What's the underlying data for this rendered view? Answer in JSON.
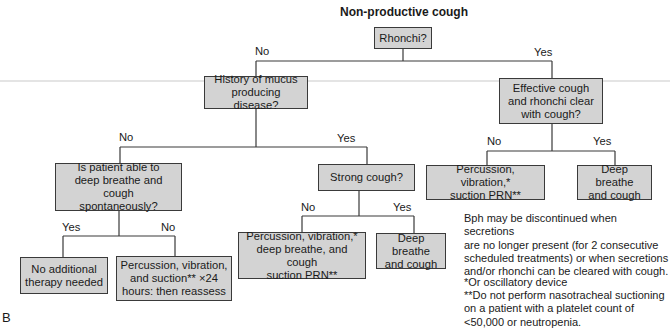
{
  "title": "Non-productive cough",
  "figure_label": "B",
  "nodes": {
    "rhonchi": "Rhonchi?",
    "history": "History of mucus\nproducing disease?",
    "effective": "Effective cough\nand rhonchi clear\nwith cough?",
    "able": "Is patient able to\ndeep breathe and cough\nspontaneously?",
    "strong": "Strong cough?",
    "perc_right": "Percussion, vibration,*\nsuction PRN**",
    "deep_right": "Deep breathe\nand cough",
    "no_therapy": "No additional\ntherapy needed",
    "perc_24": "Percussion, vibration,\nand suction** ×24\nhours: then reassess",
    "perc_mid": "Percussion, vibration,*\ndeep breathe, and cough\nsuction PRN**",
    "deep_mid": "Deep breathe\nand cough"
  },
  "edge_labels": {
    "rhonchi_no": "No",
    "rhonchi_yes": "Yes",
    "history_no": "No",
    "history_yes": "Yes",
    "effective_no": "No",
    "effective_yes": "Yes",
    "able_yes": "Yes",
    "able_no": "No",
    "strong_no": "No",
    "strong_yes": "Yes"
  },
  "notes": {
    "discontinue": "Bph may be discontinued when secretions\nare no longer present (for 2 consecutive\nscheduled treatments) or when secretions\nand/or rhonchi can be cleared with cough.",
    "footnote1": "*Or oscillatory device",
    "footnote2": "**Do not perform nasotracheal suctioning\n   on a patient with a platelet count of\n   <50,000 or neutropenia."
  },
  "colors": {
    "box_fill": "#d3d3d3",
    "box_border": "#3a3a3a",
    "line": "#3a3a3a"
  }
}
